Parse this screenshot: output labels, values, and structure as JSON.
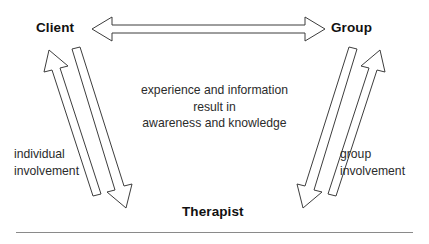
{
  "diagram": {
    "title_nodes": {
      "client": "Client",
      "group": "Group",
      "therapist": "Therapist"
    },
    "center_text": {
      "line1": "experience and information",
      "line2": "result in",
      "line3": "awareness and knowledge"
    },
    "side_labels": {
      "left_line1": "individual",
      "left_line2": "involvement",
      "right_line1": "group",
      "right_line2": "involvement"
    },
    "colors": {
      "background": "#ffffff",
      "text": "#1a1a1a",
      "arrow_stroke": "#3d3d3d",
      "arrow_fill": "#ffffff",
      "rule": "#8a8a8a"
    },
    "connectors": [
      {
        "name": "client-group-bidirectional",
        "from": "Client",
        "to": "Group",
        "style": "double-headed-hollow-horizontal"
      },
      {
        "name": "therapist-to-client",
        "from": "Therapist",
        "to": "Client",
        "style": "hollow-diagonal-up"
      },
      {
        "name": "client-to-therapist",
        "from": "Client",
        "to": "Therapist",
        "style": "hollow-diagonal-down"
      },
      {
        "name": "group-to-therapist",
        "from": "Group",
        "to": "Therapist",
        "style": "hollow-diagonal-down"
      },
      {
        "name": "therapist-to-group",
        "from": "Therapist",
        "to": "Group",
        "style": "hollow-diagonal-up"
      }
    ]
  }
}
